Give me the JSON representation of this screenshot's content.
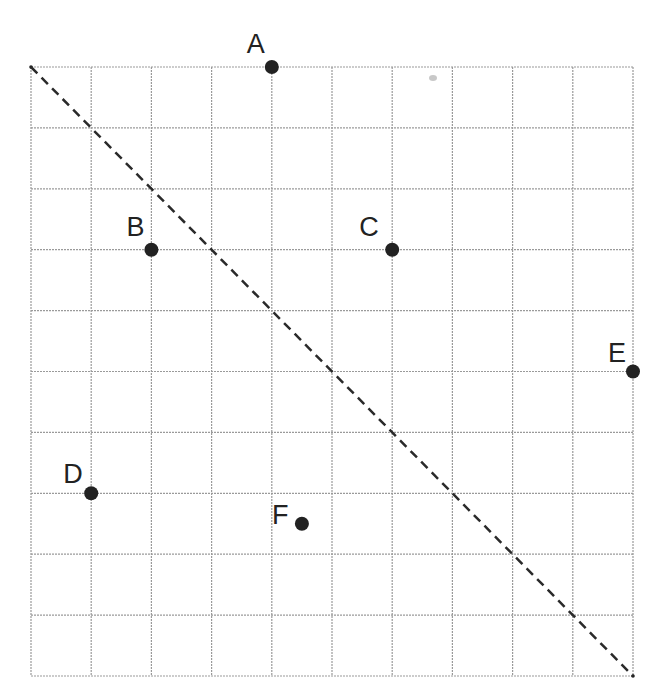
{
  "diagram": {
    "type": "coordinate-grid",
    "grid": {
      "columns": 10,
      "rows": 10,
      "origin_px": [
        31,
        67
      ],
      "cell_w": 60.2,
      "cell_h": 60.9,
      "line_color": "#9a9a9a"
    },
    "diagonal": {
      "from": [
        0,
        0
      ],
      "to": [
        10,
        10
      ],
      "style": "dashed",
      "color": "#2a2a2a"
    },
    "point_color": "#222222",
    "points": [
      {
        "label": "A",
        "gx": 4,
        "gy": 0,
        "label_dx": -25,
        "label_dy": -14
      },
      {
        "label": "B",
        "gx": 2,
        "gy": 3,
        "label_dx": -25,
        "label_dy": -14
      },
      {
        "label": "C",
        "gx": 6,
        "gy": 3,
        "label_dx": -33,
        "label_dy": -14
      },
      {
        "label": "D",
        "gx": 1,
        "gy": 7,
        "label_dx": -28,
        "label_dy": -10
      },
      {
        "label": "E",
        "gx": 10,
        "gy": 5,
        "label_dx": -25,
        "label_dy": -10
      },
      {
        "label": "F",
        "gx": 4.5,
        "gy": 7.5,
        "label_dx": -30,
        "label_dy": 0
      }
    ]
  }
}
